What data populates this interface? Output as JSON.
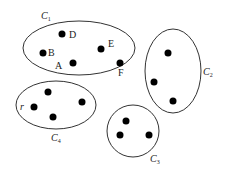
{
  "diagram": {
    "type": "cluster-diagram",
    "colors": {
      "stroke": "#333333",
      "point": "#000000",
      "background": "#ffffff"
    },
    "clusters": [
      {
        "id": "C1",
        "label_main": "C",
        "label_sub": "1",
        "shape": "ellipse",
        "points": [
          {
            "label": "D"
          },
          {
            "label": "B"
          },
          {
            "label": "A"
          },
          {
            "label": "E"
          },
          {
            "label": "F"
          }
        ]
      },
      {
        "id": "C2",
        "label_main": "C",
        "label_sub": "2",
        "shape": "ellipse",
        "points": [
          {
            "label": ""
          },
          {
            "label": ""
          },
          {
            "label": ""
          }
        ]
      },
      {
        "id": "C3",
        "label_main": "C",
        "label_sub": "3",
        "shape": "circle",
        "points": [
          {
            "label": ""
          },
          {
            "label": ""
          },
          {
            "label": ""
          }
        ]
      },
      {
        "id": "C4",
        "label_main": "C",
        "label_sub": "4",
        "shape": "ellipse",
        "points": [
          {
            "label": ""
          },
          {
            "label": "r"
          },
          {
            "label": ""
          },
          {
            "label": ""
          }
        ]
      }
    ]
  }
}
